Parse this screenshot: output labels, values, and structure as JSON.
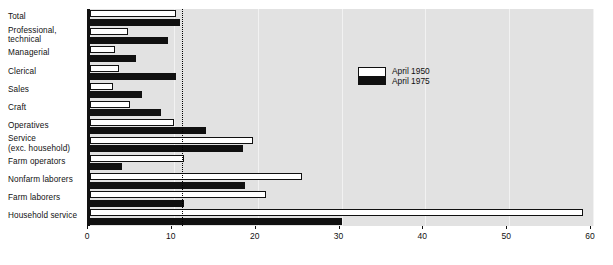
{
  "chart_data": {
    "type": "bar",
    "orientation": "horizontal",
    "title": "",
    "xlabel": "",
    "ylabel": "",
    "xlim": [
      0,
      60
    ],
    "xticks": [
      0,
      10,
      20,
      30,
      40,
      50,
      60
    ],
    "xticklabels": [
      "0",
      "10",
      "20",
      "30",
      "40",
      "50",
      "60"
    ],
    "grid": false,
    "legend_position": "center-right",
    "reference_line": 11,
    "categories": [
      "Total",
      "Professional,\ntechnical",
      "Managerial",
      "Clerical",
      "Sales",
      "Craft",
      "Operatives",
      "Service\n(exc. household)",
      "Farm operators",
      "Nonfarm laborers",
      "Farm laborers",
      "Household service"
    ],
    "series": [
      {
        "name": "April 1950",
        "color": "#ffffff",
        "values": [
          10.3,
          4.5,
          3.0,
          3.5,
          2.8,
          4.8,
          10.0,
          19.5,
          11.2,
          25.3,
          21.0,
          58.8
        ]
      },
      {
        "name": "April 1975",
        "color": "#101010",
        "values": [
          10.7,
          9.3,
          5.5,
          10.2,
          6.2,
          8.5,
          13.8,
          18.3,
          3.8,
          18.5,
          11.2,
          30.0
        ]
      }
    ]
  },
  "legend": {
    "entries": [
      {
        "label": "April 1950"
      },
      {
        "label": "April 1975"
      }
    ]
  },
  "colors": {
    "plot_background": "#e2e2e2",
    "bar_1950": "#ffffff",
    "bar_1975": "#101010",
    "axis": "#111111",
    "page_background": "#ffffff"
  }
}
